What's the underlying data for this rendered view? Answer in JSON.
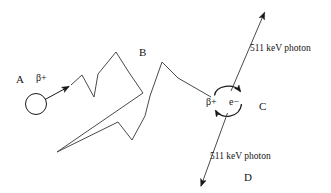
{
  "figure": {
    "type": "diagram",
    "background_color": "#ffffff",
    "stroke_color": "#1a1a1a",
    "text_color": "#151515"
  },
  "labels": {
    "point_a": "A",
    "point_b": "B",
    "point_c": "C",
    "point_d": "D",
    "positron_emitted": "β+",
    "positron_at_annihilation": "β+",
    "electron": "e−",
    "photon_up": "511 keV photon",
    "photon_down": "511 keV photon"
  },
  "geometry": {
    "nucleus_circle": {
      "cx": 36,
      "cy": 104,
      "r": 10.5
    },
    "emission_arrow": {
      "x1": 45,
      "y1": 99,
      "x2": 71,
      "y2": 85
    },
    "positron_track": "71,85 82,75 94,97 98,74 116,52 128,71 143,93 57,152 118,122 132,140 145,116 150,96 162,62 178,78 211,97",
    "annihilation_arcs": {
      "top_arc": {
        "start": [
          215,
          98
        ],
        "end": [
          240,
          93
        ],
        "sweep": "right-over"
      },
      "bottom_arc": {
        "start": [
          241,
          101
        ],
        "end": [
          216,
          109
        ],
        "sweep": "left-under"
      }
    },
    "photon_up_arrow": {
      "x1": 230,
      "y1": 92,
      "x2": 264,
      "y2": 12
    },
    "photon_down_arrow": {
      "x1": 228,
      "y1": 112,
      "x2": 201,
      "y2": 186
    }
  },
  "positions": {
    "point_a": {
      "left": 16,
      "top": 74
    },
    "point_b": {
      "left": 139,
      "top": 47
    },
    "point_c": {
      "left": 259,
      "top": 101
    },
    "point_d": {
      "left": 244,
      "top": 172
    },
    "positron_emitted": {
      "left": 36,
      "top": 73
    },
    "positron_at_annihilation": {
      "left": 206,
      "top": 97
    },
    "electron": {
      "left": 229,
      "top": 97
    },
    "photon_up": {
      "left": 250,
      "top": 44
    },
    "photon_down": {
      "left": 210,
      "top": 152
    }
  }
}
